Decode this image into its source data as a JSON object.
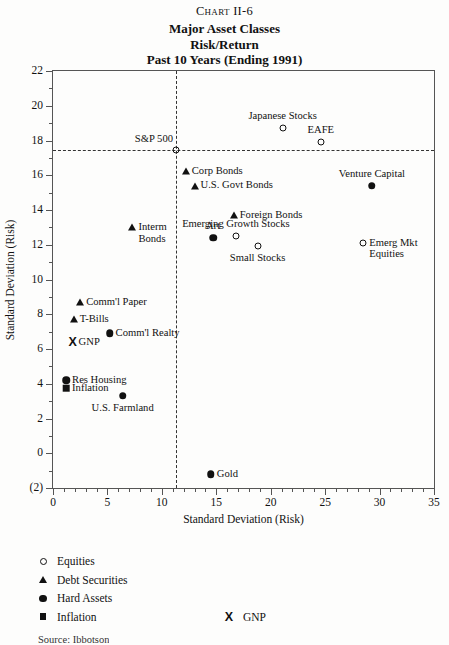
{
  "header": {
    "chart_number": "Chart II-6",
    "title_lines": [
      "Major Asset Classes",
      "Risk/Return",
      "Past 10 Years (Ending 1991)"
    ]
  },
  "footer": {
    "note": "Source: Ibbotson"
  },
  "legend": {
    "items": [
      {
        "marker": "open-circle-icon",
        "label": "Equities"
      },
      {
        "marker": "triangle-icon",
        "label": "Debt Securities"
      },
      {
        "marker": "solid-circle-icon",
        "label": "Hard Assets"
      },
      {
        "marker": "square-icon",
        "label": "Inflation"
      }
    ],
    "gnp": {
      "marker": "x-icon",
      "label": "GNP"
    }
  },
  "chart_data": {
    "type": "scatter",
    "title": "Major Asset Classes Risk/Return Past 10 Years (Ending 1991)",
    "xlabel": "Standard Deviation (Risk)",
    "ylabel": "Standard Deviation (Risk)",
    "xlim": [
      0,
      35
    ],
    "ylim": [
      -2,
      22
    ],
    "xticks": [
      0,
      5,
      10,
      15,
      20,
      25,
      30,
      35
    ],
    "xtick_labels": [
      "0",
      "5",
      "10",
      "15",
      "20",
      "25",
      "30",
      "35"
    ],
    "yticks": [
      -2,
      0,
      2,
      4,
      6,
      8,
      10,
      12,
      14,
      16,
      18,
      20,
      22
    ],
    "ytick_labels": [
      "(2)",
      "0",
      "2",
      "4",
      "6",
      "8",
      "10",
      "12",
      "14",
      "16",
      "18",
      "20",
      "22"
    ],
    "minor_tick_step": 1,
    "grid": false,
    "legend_position": "below-plot-left",
    "reference_lines": [
      {
        "name": "sp500-vertical",
        "orientation": "vertical",
        "value": 11.3,
        "style": "dashed"
      },
      {
        "name": "sp500-horizontal",
        "orientation": "horizontal",
        "value": 17.45,
        "style": "dashed"
      }
    ],
    "categories": [
      "Equities",
      "Debt Securities",
      "Hard Assets",
      "Inflation",
      "GNP"
    ],
    "points": [
      {
        "label": "S&P 500",
        "x": 11.3,
        "y": 17.45,
        "marker": "open-circle",
        "category": "Equities",
        "label_pos": "above-left"
      },
      {
        "label": "Japanese Stocks",
        "x": 21.1,
        "y": 18.7,
        "marker": "open-circle",
        "category": "Equities",
        "label_pos": "above"
      },
      {
        "label": "EAFE",
        "x": 24.6,
        "y": 17.9,
        "marker": "open-circle",
        "category": "Equities",
        "label_pos": "above"
      },
      {
        "label": "Venture Capital",
        "x": 29.3,
        "y": 15.4,
        "marker": "solid-circle",
        "category": "Hard Assets",
        "label_pos": "above"
      },
      {
        "label": "Corp Bonds",
        "x": 12.2,
        "y": 16.25,
        "marker": "triangle",
        "category": "Debt Securities",
        "label_pos": "right"
      },
      {
        "label": "U.S. Govt Bonds",
        "x": 13.0,
        "y": 15.4,
        "marker": "triangle",
        "category": "Debt Securities",
        "label_pos": "right"
      },
      {
        "label": "Foreign Bonds",
        "x": 16.6,
        "y": 13.7,
        "marker": "triangle",
        "category": "Debt Securities",
        "label_pos": "right"
      },
      {
        "label": "Interm\nBonds",
        "x": 7.3,
        "y": 13.0,
        "marker": "triangle",
        "category": "Debt Securities",
        "label_pos": "right"
      },
      {
        "label": "Art",
        "x": 14.7,
        "y": 12.4,
        "marker": "solid-circle",
        "category": "Hard Assets",
        "label_pos": "above"
      },
      {
        "label": "Emerging Growth Stocks",
        "x": 16.8,
        "y": 12.5,
        "marker": "open-circle",
        "category": "Equities",
        "label_pos": "above"
      },
      {
        "label": "Small Stocks",
        "x": 18.8,
        "y": 11.9,
        "marker": "open-circle",
        "category": "Equities",
        "label_pos": "below"
      },
      {
        "label": "Emerg Mkt\nEquities",
        "x": 28.5,
        "y": 12.1,
        "marker": "open-circle",
        "category": "Equities",
        "label_pos": "right"
      },
      {
        "label": "Comm'l Paper",
        "x": 2.5,
        "y": 8.7,
        "marker": "triangle",
        "category": "Debt Securities",
        "label_pos": "right"
      },
      {
        "label": "T-Bills",
        "x": 1.9,
        "y": 7.7,
        "marker": "triangle",
        "category": "Debt Securities",
        "label_pos": "right"
      },
      {
        "label": "Comm'l Realty",
        "x": 5.2,
        "y": 6.9,
        "marker": "solid-circle",
        "category": "Hard Assets",
        "label_pos": "right"
      },
      {
        "label": "GNP",
        "x": 1.8,
        "y": 6.4,
        "marker": "x",
        "category": "GNP",
        "label_pos": "right"
      },
      {
        "label": "Res Housing",
        "x": 1.2,
        "y": 4.2,
        "marker": "solid-circle",
        "category": "Hard Assets",
        "label_pos": "right"
      },
      {
        "label": "Inflation",
        "x": 1.2,
        "y": 3.75,
        "marker": "square",
        "category": "Inflation",
        "label_pos": "right"
      },
      {
        "label": "U.S. Farmland",
        "x": 6.4,
        "y": 3.3,
        "marker": "solid-circle",
        "category": "Hard Assets",
        "label_pos": "below"
      },
      {
        "label": "Gold",
        "x": 14.5,
        "y": -1.2,
        "marker": "solid-circle",
        "category": "Hard Assets",
        "label_pos": "right"
      }
    ]
  }
}
